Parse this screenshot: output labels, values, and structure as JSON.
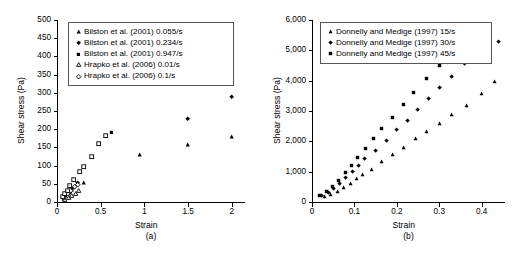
{
  "figure": {
    "panels": [
      {
        "caption": "(a)",
        "xlabel": "Strain",
        "ylabel": "Shear stress (Pa)"
      },
      {
        "caption": "(b)",
        "xlabel": "Strain",
        "ylabel": "Shear stress (Pa)"
      }
    ]
  },
  "chart_data": [
    {
      "type": "scatter",
      "title": "",
      "subtitle": "",
      "caption": "(a)",
      "xlabel": "Strain",
      "ylabel": "Shear stress (Pa)",
      "xlim": [
        0,
        2.15
      ],
      "ylim": [
        0,
        500
      ],
      "xticks": [
        "0",
        "0.5",
        "1",
        "1.5",
        "2"
      ],
      "xtick_values": [
        0,
        0.5,
        1,
        1.5,
        2
      ],
      "yticks": [
        "0",
        "50",
        "100",
        "150",
        "200",
        "250",
        "300",
        "350",
        "400",
        "450",
        "500"
      ],
      "ytick_values": [
        0,
        50,
        100,
        150,
        200,
        250,
        300,
        350,
        400,
        450,
        500
      ],
      "grid": false,
      "legend_position": "top-left-inside",
      "series": [
        {
          "name": "Bilston et al. (2001) 0.055/s",
          "marker": "filled-triangle",
          "color": "#000000",
          "points": [
            [
              0.08,
              10
            ],
            [
              0.12,
              22
            ],
            [
              0.17,
              34
            ],
            [
              0.22,
              48
            ],
            [
              0.3,
              52
            ],
            [
              0.95,
              130
            ],
            [
              1.5,
              158
            ],
            [
              2.0,
              180
            ]
          ]
        },
        {
          "name": "Bilston et al. (2001) 0.234/s",
          "marker": "filled-diamond",
          "color": "#000000",
          "points": [
            [
              0.09,
              14
            ],
            [
              0.14,
              26
            ],
            [
              0.19,
              40
            ],
            [
              0.24,
              52
            ],
            [
              1.5,
              230
            ],
            [
              2.0,
              290
            ]
          ]
        },
        {
          "name": "Bilston et al. (2001) 0.947/s",
          "marker": "filled-square",
          "color": "#000000",
          "points": [
            [
              0.1,
              18
            ],
            [
              0.15,
              30
            ],
            [
              0.62,
              191
            ],
            [
              1.5,
              350
            ],
            [
              2.0,
              400
            ]
          ]
        },
        {
          "name": "Hrapko et al. (2006) 0.01/s",
          "marker": "open-triangle",
          "color": "#000000",
          "points": [
            [
              0.09,
              6
            ],
            [
              0.13,
              12
            ],
            [
              0.17,
              18
            ],
            [
              0.21,
              24
            ],
            [
              0.25,
              30
            ]
          ]
        },
        {
          "name": "Hrapko et al. (2006) 0.1/s",
          "marker": "open-diamond",
          "color": "#000000",
          "points": [
            [
              0.08,
              12
            ],
            [
              0.12,
              22
            ],
            [
              0.16,
              32
            ],
            [
              0.2,
              42
            ],
            [
              0.24,
              47
            ]
          ]
        },
        {
          "name": "Hrapko et al. (2006) open squares",
          "marker": "open-square",
          "color": "#000000",
          "points": [
            [
              0.06,
              14
            ],
            [
              0.09,
              22
            ],
            [
              0.12,
              32
            ],
            [
              0.15,
              44
            ],
            [
              0.19,
              62
            ],
            [
              0.26,
              82
            ],
            [
              0.31,
              96
            ],
            [
              0.4,
              125
            ],
            [
              0.48,
              161
            ],
            [
              0.56,
              181
            ]
          ]
        }
      ]
    },
    {
      "type": "scatter",
      "title": "",
      "subtitle": "",
      "caption": "(b)",
      "xlabel": "Strain",
      "ylabel": "Shear stress (Pa)",
      "xlim": [
        0,
        0.455
      ],
      "ylim": [
        0,
        6000
      ],
      "xticks": [
        "0",
        "0.1",
        "0.2",
        "0.3",
        "0.4"
      ],
      "xtick_values": [
        0,
        0.1,
        0.2,
        0.3,
        0.4
      ],
      "yticks": [
        "0",
        "1,000",
        "2,000",
        "3,000",
        "4,000",
        "5,000",
        "6,000"
      ],
      "ytick_values": [
        0,
        1000,
        2000,
        3000,
        4000,
        5000,
        6000
      ],
      "grid": false,
      "legend_position": "top-left-inside",
      "series": [
        {
          "name": "Donnelly and Medige (1997) 15/s",
          "marker": "filled-triangle",
          "color": "#000000",
          "points": [
            [
              0.03,
              190
            ],
            [
              0.045,
              230
            ],
            [
              0.06,
              330
            ],
            [
              0.075,
              480
            ],
            [
              0.09,
              620
            ],
            [
              0.105,
              760
            ],
            [
              0.12,
              900
            ],
            [
              0.14,
              1080
            ],
            [
              0.165,
              1320
            ],
            [
              0.19,
              1560
            ],
            [
              0.215,
              1800
            ],
            [
              0.245,
              2080
            ],
            [
              0.27,
              2320
            ],
            [
              0.3,
              2600
            ],
            [
              0.33,
              2880
            ],
            [
              0.365,
              3180
            ],
            [
              0.4,
              3560
            ],
            [
              0.43,
              3960
            ]
          ]
        },
        {
          "name": "Donnelly and Medige (1997) 30/s",
          "marker": "filled-diamond",
          "color": "#000000",
          "points": [
            [
              0.022,
              200
            ],
            [
              0.038,
              300
            ],
            [
              0.05,
              430
            ],
            [
              0.065,
              620
            ],
            [
              0.08,
              800
            ],
            [
              0.095,
              1000
            ],
            [
              0.11,
              1200
            ],
            [
              0.125,
              1420
            ],
            [
              0.15,
              1700
            ],
            [
              0.175,
              2020
            ],
            [
              0.2,
              2380
            ],
            [
              0.225,
              2700
            ],
            [
              0.25,
              3060
            ],
            [
              0.275,
              3420
            ],
            [
              0.3,
              3760
            ],
            [
              0.33,
              4150
            ],
            [
              0.36,
              4560
            ],
            [
              0.39,
              4900
            ],
            [
              0.415,
              5120
            ],
            [
              0.44,
              5300
            ]
          ]
        },
        {
          "name": "Donnelly and Medige (1997) 45/s",
          "marker": "filled-square",
          "color": "#000000",
          "points": [
            [
              0.018,
              210
            ],
            [
              0.035,
              360
            ],
            [
              0.048,
              520
            ],
            [
              0.062,
              700
            ],
            [
              0.078,
              960
            ],
            [
              0.092,
              1200
            ],
            [
              0.108,
              1480
            ],
            [
              0.125,
              1780
            ],
            [
              0.145,
              2080
            ],
            [
              0.165,
              2420
            ],
            [
              0.19,
              2800
            ],
            [
              0.215,
              3200
            ],
            [
              0.24,
              3620
            ],
            [
              0.27,
              4060
            ],
            [
              0.3,
              4500
            ],
            [
              0.33,
              4920
            ],
            [
              0.365,
              5400
            ],
            [
              0.395,
              5600
            ]
          ]
        }
      ]
    }
  ]
}
